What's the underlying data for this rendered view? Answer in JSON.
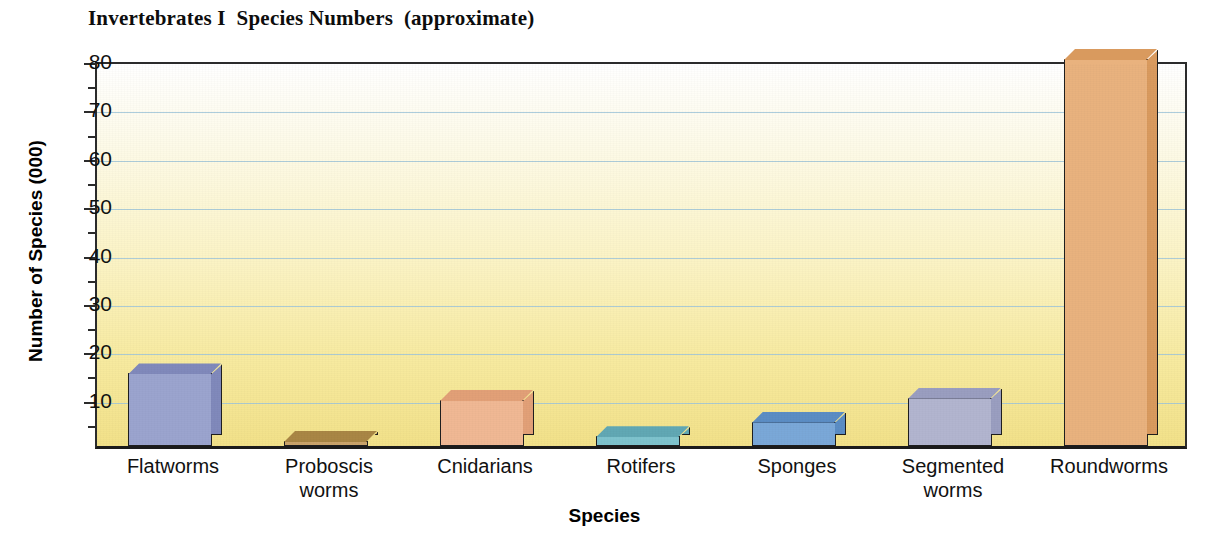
{
  "chart_data": {
    "type": "bar",
    "title": "Invertebrates I  Species Numbers  (approximate)",
    "xlabel": "Species",
    "ylabel": "Number of Species (000)",
    "ylim": [
      0,
      80
    ],
    "ytick_step": 10,
    "yminor_step": 5,
    "grid": true,
    "legend": "none",
    "units_note": "thousands of species",
    "categories": [
      "Flatworms",
      "Proboscis worms",
      "Cnidarians",
      "Rotifers",
      "Sponges",
      "Segmented worms",
      "Roundworms"
    ],
    "values": [
      15,
      1,
      9.5,
      2,
      5,
      10,
      80
    ],
    "bar_colors": [
      "#9ba4ce",
      "#caa46b",
      "#f0b894",
      "#7ec3cd",
      "#7aa8d8",
      "#b2b5cf",
      "#e9b27e"
    ],
    "bar_side_colors": [
      "#8089bb",
      "#a98645",
      "#e2a077",
      "#61a8b4",
      "#5b8dc4",
      "#9a9ec0",
      "#d99a5e"
    ],
    "ytick_labels": [
      "10",
      "20",
      "30",
      "40",
      "50",
      "60",
      "70",
      "80"
    ],
    "ytick_values": [
      10,
      20,
      30,
      40,
      50,
      60,
      70,
      80
    ],
    "yminor_values": [
      5,
      15,
      25,
      35,
      45,
      55,
      65,
      75
    ],
    "background_top_color": "#ffffff",
    "background_bottom_color": "#f2e189",
    "gridline_color": "#9fc4d8",
    "axis_color": "#1e1e1e"
  },
  "axis": {
    "y_title": "Number of Species (000)",
    "x_title": "Species"
  },
  "category_lines": [
    {
      "l1": "Flatworms",
      "l2": ""
    },
    {
      "l1": "Proboscis",
      "l2": "worms"
    },
    {
      "l1": "Cnidarians",
      "l2": ""
    },
    {
      "l1": "Rotifers",
      "l2": ""
    },
    {
      "l1": "Sponges",
      "l2": ""
    },
    {
      "l1": "Segmented",
      "l2": "worms"
    },
    {
      "l1": "Roundworms",
      "l2": ""
    }
  ]
}
